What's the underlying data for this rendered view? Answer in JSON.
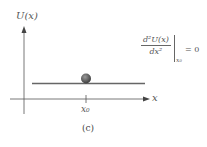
{
  "figure": {
    "y_axis_label": "U(x)",
    "x_axis_label": "x",
    "tick_label": "x₀",
    "caption": "(c)",
    "formula": {
      "numerator": "d²U(x)",
      "denominator": "dx²",
      "evaluated_at": "x₀",
      "equals": "= 0"
    },
    "colors": {
      "axis": "#444444",
      "potential_line": "#666666",
      "ball": "#555555"
    }
  }
}
